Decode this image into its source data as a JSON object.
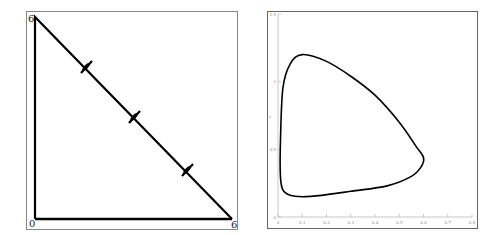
{
  "left_panel": {
    "title": "",
    "labels": {
      "origin": "0",
      "y_max": "6",
      "x_max": "6"
    },
    "shape": "right triangle simplex with three tick marks along hypotenuse",
    "vertices": [
      [
        0,
        0
      ],
      [
        0,
        6
      ],
      [
        6,
        0
      ]
    ],
    "hypotenuse_ticks": [
      {
        "x": 1.5,
        "y": 4.5
      },
      {
        "x": 3.0,
        "y": 3.0
      },
      {
        "x": 4.6,
        "y": 1.4
      }
    ],
    "colors": {
      "line": "#000000",
      "frame": "#888888",
      "background": "#ffffff"
    }
  },
  "right_panel": {
    "chart_type": "closed orbit (limit cycle) phase plot",
    "x_axis": {
      "label": "",
      "min": 0,
      "max": 0.8,
      "ticks": [
        "0",
        "0.1",
        "0.2",
        "0.3",
        "0.4",
        "0.5",
        "0.6",
        "0.7",
        "0.8"
      ]
    },
    "y_axis": {
      "label": "y",
      "min": 0,
      "max": 1.5,
      "ticks": [
        "0",
        "0.5",
        "1",
        "1.5"
      ]
    },
    "colors": {
      "curve": "#000000",
      "axis": "#bbbbbb",
      "frame": "#666666",
      "background": "#ffffff"
    }
  },
  "chart_data": {
    "type": "line",
    "title": "",
    "xlabel": "",
    "ylabel": "y",
    "xlim": [
      0,
      0.8
    ],
    "ylim": [
      0,
      1.5
    ],
    "grid": false,
    "series": [
      {
        "name": "limit cycle",
        "closed": true,
        "x": [
          0.01,
          0.02,
          0.05,
          0.1,
          0.2,
          0.3,
          0.4,
          0.5,
          0.57,
          0.6,
          0.59,
          0.55,
          0.45,
          0.3,
          0.18,
          0.1,
          0.05,
          0.02,
          0.01,
          0.01
        ],
        "y": [
          0.55,
          0.95,
          1.13,
          1.2,
          1.15,
          1.04,
          0.9,
          0.7,
          0.52,
          0.44,
          0.37,
          0.3,
          0.23,
          0.19,
          0.16,
          0.15,
          0.16,
          0.2,
          0.3,
          0.55
        ]
      }
    ]
  }
}
